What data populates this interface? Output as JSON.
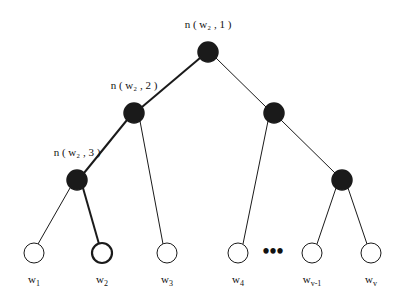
{
  "diagram": {
    "type": "binary-huffman-tree",
    "title": "",
    "colors": {
      "internal_node_fill": "#1a1a1a",
      "leaf_node_fill": "#ffffff",
      "stroke": "#1a1a1a",
      "highlight_stroke": "#1a1a1a",
      "background": "#ffffff",
      "text": "#111111"
    },
    "internal_nodes": [
      {
        "id": "root",
        "cx": 208,
        "cy": 52,
        "r": 10,
        "label": "n ( w₂ , 1 )",
        "label_x": 208,
        "label_y": 28,
        "label_anchor": "middle",
        "highlighted": true
      },
      {
        "id": "L",
        "cx": 134,
        "cy": 113,
        "r": 10,
        "label": "n ( w₂ , 2 )",
        "label_x": 134,
        "label_y": 89,
        "label_anchor": "middle",
        "highlighted": true
      },
      {
        "id": "R",
        "cx": 274,
        "cy": 113,
        "r": 10,
        "label": "",
        "label_x": 0,
        "label_y": 0,
        "label_anchor": "middle",
        "highlighted": false
      },
      {
        "id": "LL",
        "cx": 77,
        "cy": 180,
        "r": 10,
        "label": "n ( w₂ , 3 )",
        "label_x": 77,
        "label_y": 156,
        "label_anchor": "middle",
        "highlighted": true
      },
      {
        "id": "RR",
        "cx": 342,
        "cy": 180,
        "r": 10,
        "label": "",
        "label_x": 0,
        "label_y": 0,
        "label_anchor": "middle",
        "highlighted": false
      }
    ],
    "leaf_nodes": [
      {
        "id": "w1",
        "cx": 34,
        "cy": 253,
        "r": 10,
        "label": "w",
        "sub": "1",
        "highlighted": false
      },
      {
        "id": "w2",
        "cx": 102,
        "cy": 253,
        "r": 10,
        "label": "w",
        "sub": "2",
        "highlighted": true
      },
      {
        "id": "w3",
        "cx": 167,
        "cy": 253,
        "r": 10,
        "label": "w",
        "sub": "3",
        "highlighted": false
      },
      {
        "id": "w4",
        "cx": 238,
        "cy": 253,
        "r": 10,
        "label": "w",
        "sub": "4",
        "highlighted": false
      },
      {
        "id": "wv1",
        "cx": 312,
        "cy": 253,
        "r": 10,
        "label": "w",
        "sub": "v-1",
        "highlighted": false
      },
      {
        "id": "wv",
        "cx": 371,
        "cy": 253,
        "r": 10,
        "label": "w",
        "sub": "v",
        "highlighted": false
      }
    ],
    "edges": [
      {
        "from": "root",
        "to": "L",
        "x1": 200,
        "y1": 58,
        "x2": 142,
        "y2": 107,
        "highlighted": true
      },
      {
        "from": "root",
        "to": "R",
        "x1": 216,
        "y1": 58,
        "x2": 266,
        "y2": 107,
        "highlighted": false
      },
      {
        "from": "L",
        "to": "LL",
        "x1": 127,
        "y1": 120,
        "x2": 84,
        "y2": 173,
        "highlighted": true
      },
      {
        "from": "L",
        "to": "w3",
        "x1": 140,
        "y1": 121,
        "x2": 163,
        "y2": 244,
        "highlighted": false
      },
      {
        "from": "R",
        "to": "w4",
        "x1": 268,
        "y1": 121,
        "x2": 243,
        "y2": 244,
        "highlighted": false
      },
      {
        "from": "R",
        "to": "RR",
        "x1": 281,
        "y1": 120,
        "x2": 335,
        "y2": 173,
        "highlighted": false
      },
      {
        "from": "LL",
        "to": "w1",
        "x1": 70,
        "y1": 188,
        "x2": 38,
        "y2": 244,
        "highlighted": false
      },
      {
        "from": "LL",
        "to": "w2",
        "x1": 83,
        "y1": 188,
        "x2": 99,
        "y2": 244,
        "highlighted": true
      },
      {
        "from": "RR",
        "to": "wv1",
        "x1": 336,
        "y1": 188,
        "x2": 317,
        "y2": 244,
        "highlighted": false
      },
      {
        "from": "RR",
        "to": "wv",
        "x1": 348,
        "y1": 188,
        "x2": 367,
        "y2": 244,
        "highlighted": false
      }
    ],
    "annotations": [
      {
        "id": "ellipsis",
        "text": "•••",
        "x": 273,
        "y": 258
      }
    ]
  }
}
